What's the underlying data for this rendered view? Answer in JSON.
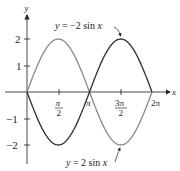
{
  "chart_data": {
    "type": "line",
    "title": "",
    "xlabel": "x",
    "ylabel": "y",
    "xlim": [
      0,
      6.2832
    ],
    "ylim": [
      -2,
      2
    ],
    "grid": false,
    "x_ticks": [
      {
        "value": 1.5708,
        "num": "π",
        "den": "2"
      },
      {
        "value": 3.1416,
        "label": "π"
      },
      {
        "value": 4.7124,
        "num": "3π",
        "den": "2"
      },
      {
        "value": 6.2832,
        "label": "2π"
      }
    ],
    "y_ticks": [
      {
        "value": 2,
        "label": "2"
      },
      {
        "value": 1,
        "label": "1"
      },
      {
        "value": -1,
        "label": "−1"
      },
      {
        "value": -2,
        "label": "−2"
      }
    ],
    "series": [
      {
        "name": "y = 2 sin x",
        "amplitude": 2,
        "color": "#8a8a8a",
        "x": [
          0,
          1.5708,
          3.1416,
          4.7124,
          6.2832
        ],
        "values": [
          0,
          2,
          0,
          -2,
          0
        ]
      },
      {
        "name": "y = −2 sin x",
        "amplitude": -2,
        "color": "#2e2e2e",
        "x": [
          0,
          1.5708,
          3.1416,
          4.7124,
          6.2832
        ],
        "values": [
          0,
          -2,
          0,
          2,
          0
        ]
      }
    ],
    "annotations": [
      {
        "text": "y = −2 sin x",
        "target_series": "y = −2 sin x"
      },
      {
        "text": "y = 2 sin x",
        "target_series": "y = 2 sin x"
      }
    ]
  },
  "labels": {
    "top_annotation": "y = −2 sin x",
    "bottom_annotation": "y = 2 sin x",
    "x_axis": "x",
    "y_axis": "y",
    "tick_pi_half_num": "π",
    "tick_pi_half_den": "2",
    "tick_pi": "π",
    "tick_3pi_half_num": "3π",
    "tick_3pi_half_den": "2",
    "tick_2pi": "2π",
    "tick_y2": "2",
    "tick_y1": "1",
    "tick_ym1": "−1",
    "tick_ym2": "−2"
  }
}
